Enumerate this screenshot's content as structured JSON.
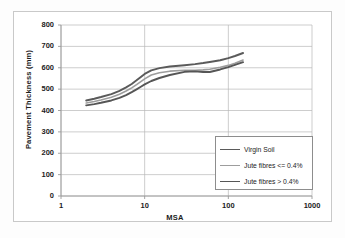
{
  "chart_data": {
    "type": "line",
    "title": "",
    "xlabel": "MSA",
    "ylabel": "Pavement Thickness (mm)",
    "xscale": "log",
    "xlim": [
      1,
      1000
    ],
    "ylim": [
      0,
      800
    ],
    "xticks": [
      "1",
      "10",
      "100",
      "1000"
    ],
    "yticks": [
      "0",
      "100",
      "200",
      "300",
      "400",
      "500",
      "600",
      "700",
      "800"
    ],
    "grid": "horizontal-and-vertical",
    "legend_position": "lower-right",
    "series": [
      {
        "name": "Virgin Soil",
        "color": "#5a5a5a",
        "width": 1.9,
        "points": [
          [
            2,
            447
          ],
          [
            2.5,
            455
          ],
          [
            3,
            463
          ],
          [
            4,
            477
          ],
          [
            5,
            492
          ],
          [
            6,
            508
          ],
          [
            7,
            524
          ],
          [
            8,
            541
          ],
          [
            9,
            557
          ],
          [
            10,
            571
          ],
          [
            12,
            588
          ],
          [
            15,
            598
          ],
          [
            20,
            606
          ],
          [
            30,
            612
          ],
          [
            40,
            617
          ],
          [
            50,
            622
          ],
          [
            60,
            627
          ],
          [
            80,
            635
          ],
          [
            100,
            645
          ],
          [
            120,
            655
          ],
          [
            150,
            669
          ]
        ]
      },
      {
        "name": "Jute fibres <= 0.4%",
        "color": "#9d9d9d",
        "width": 1.6,
        "points": [
          [
            2,
            435
          ],
          [
            2.5,
            442
          ],
          [
            3,
            449
          ],
          [
            4,
            462
          ],
          [
            5,
            476
          ],
          [
            6,
            491
          ],
          [
            7,
            506
          ],
          [
            8,
            521
          ],
          [
            9,
            535
          ],
          [
            10,
            548
          ],
          [
            12,
            566
          ],
          [
            15,
            577
          ],
          [
            20,
            584
          ],
          [
            30,
            588
          ],
          [
            40,
            588
          ],
          [
            50,
            590
          ],
          [
            60,
            593
          ],
          [
            80,
            602
          ],
          [
            100,
            611
          ],
          [
            120,
            621
          ],
          [
            150,
            636
          ]
        ]
      },
      {
        "name": "Jute fibres > 0.4%",
        "color": "#565656",
        "width": 1.9,
        "points": [
          [
            2,
            424
          ],
          [
            2.5,
            430
          ],
          [
            3,
            436
          ],
          [
            4,
            447
          ],
          [
            5,
            459
          ],
          [
            6,
            472
          ],
          [
            7,
            486
          ],
          [
            8,
            499
          ],
          [
            9,
            511
          ],
          [
            10,
            522
          ],
          [
            12,
            538
          ],
          [
            15,
            552
          ],
          [
            20,
            566
          ],
          [
            30,
            581
          ],
          [
            40,
            583
          ],
          [
            50,
            580
          ],
          [
            60,
            580
          ],
          [
            80,
            592
          ],
          [
            100,
            603
          ],
          [
            120,
            613
          ],
          [
            150,
            626
          ]
        ]
      }
    ]
  },
  "axes": {
    "ylabel": "Pavement Thickness (mm)",
    "xlabel": "MSA",
    "yticks": [
      "800",
      "700",
      "600",
      "500",
      "400",
      "300",
      "200",
      "100",
      "0"
    ],
    "xticks": [
      "1",
      "10",
      "100",
      "1000"
    ]
  },
  "legend": {
    "entries": [
      {
        "label": "Virgin Soil",
        "color": "#5a5a5a",
        "width": "1.9px"
      },
      {
        "label": "Jute fibres <= 0.4%",
        "color": "#9d9d9d",
        "width": "1.4px"
      },
      {
        "label": "Jute fibres > 0.4%",
        "color": "#565656",
        "width": "1.9px"
      }
    ]
  },
  "colors": {
    "grid": "#b8b8b8",
    "axis": "#9a9a9a",
    "frame": "#c9c9c9",
    "text": "#1c1c1c"
  }
}
